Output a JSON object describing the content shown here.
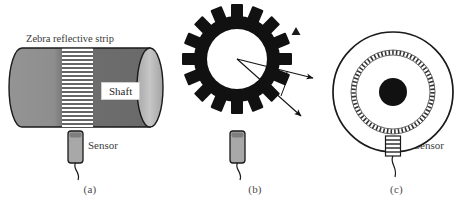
{
  "figure": {
    "width": 468,
    "height": 198,
    "background": "#ffffff",
    "ink": "#1a1a1a",
    "text_color": "#3d3d3d"
  },
  "panels": [
    {
      "id": "a",
      "caption": "(a)",
      "title_label": "Zebra reflective strip",
      "shaft_label": "Shaft",
      "sensor_label": "Sensor",
      "description": "Cylindrical shaft with zebra reflective striped band and proximity sensor",
      "cylinder": {
        "body_fill_left": "#9a9a9a",
        "body_fill_right": "#6f6f6f",
        "endcap_fill": "#bdbdbd",
        "outline": "#1a1a1a",
        "stripe_count": 19,
        "stripe_color": "#ffffff",
        "stripe_band_background": "#5e5e5e"
      },
      "sensor": {
        "body_fill": "#a8a8a8",
        "top_fill": "#8a8a8a",
        "outline": "#1a1a1a"
      }
    },
    {
      "id": "b",
      "caption": "(b)",
      "sensor_label": "Sensor",
      "angle_label": "Δθ",
      "description": "Toothed gear wheel with angular increment between two teeth and proximity sensor",
      "gear": {
        "tooth_count": 16,
        "fill": "#111111",
        "bore_fill": "#ffffff"
      },
      "marker": "triangle-marker",
      "sensor": {
        "body_fill": "#a8a8a8",
        "top_fill": "#8a8a8a",
        "outline": "#1a1a1a"
      }
    },
    {
      "id": "c",
      "caption": "(c)",
      "sensor_label": "Sensor",
      "description": "Encoder disc with outer rim, dashed incremental track ring and central hub with sensor at bottom",
      "disc": {
        "outer_ring_stroke": "#1a1a1a",
        "track_ring_stroke": "#555555",
        "tick_count": 72,
        "hub_fill": "#111111"
      },
      "sensor": {
        "body_fill": "#ffffff",
        "stripe_color": "#333333",
        "stripe_count": 5,
        "outline": "#1a1a1a"
      }
    }
  ]
}
